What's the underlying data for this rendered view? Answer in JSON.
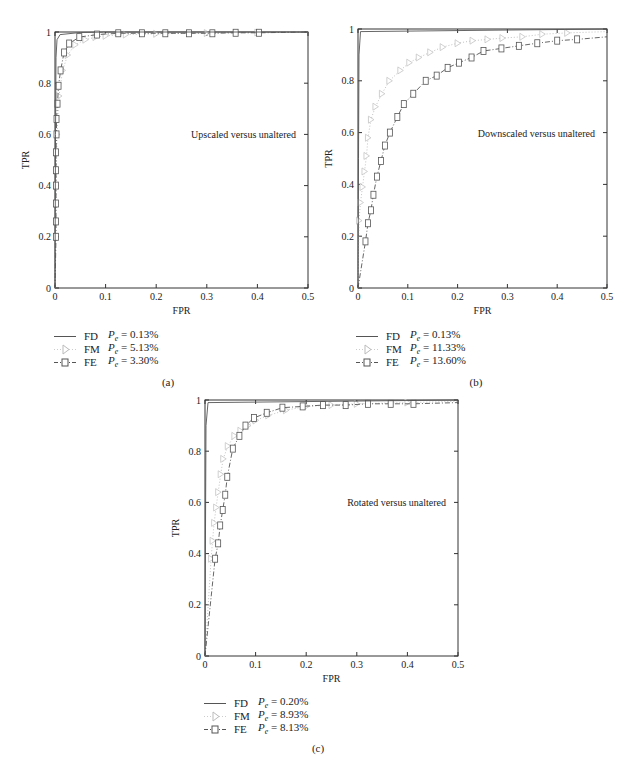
{
  "chart_data": [
    {
      "id": "a",
      "type": "line",
      "caption": "(a)",
      "annotation": "Upscaled versus unaltered",
      "xlabel": "FPR",
      "ylabel": "TPR",
      "xlim": [
        0,
        0.5
      ],
      "ylim": [
        0,
        1
      ],
      "xticks": [
        "0",
        "0.1",
        "0.2",
        "0.3",
        "0.4",
        "0.5"
      ],
      "yticks": [
        "0",
        "0.2",
        "0.4",
        "0.6",
        "0.8",
        "1"
      ],
      "grid": false,
      "legend_position": "below",
      "series": [
        {
          "name": "FD",
          "pe": "0.13%",
          "style": "solid",
          "color": "#555555",
          "marker": "none",
          "x": [
            0,
            0.001,
            0.002,
            0.004,
            0.01,
            0.05,
            0.1,
            0.5
          ],
          "y": [
            0,
            0.6,
            0.9,
            0.97,
            0.99,
            0.998,
            1.0,
            1.0
          ]
        },
        {
          "name": "FM",
          "pe": "5.13%",
          "style": "dotted",
          "color": "#bbbbbb",
          "marker": "triangle",
          "x": [
            0,
            0.002,
            0.004,
            0.008,
            0.015,
            0.025,
            0.04,
            0.06,
            0.08,
            0.1,
            0.14,
            0.2,
            0.3,
            0.4,
            0.5
          ],
          "y": [
            0,
            0.4,
            0.6,
            0.75,
            0.85,
            0.91,
            0.95,
            0.97,
            0.98,
            0.985,
            0.99,
            0.993,
            0.996,
            0.998,
            1.0
          ]
        },
        {
          "name": "FE",
          "pe": "3.30%",
          "style": "dashdot",
          "color": "#555555",
          "marker": "square",
          "x": [
            0,
            0.002,
            0.002,
            0.002,
            0.002,
            0.002,
            0.002,
            0.003,
            0.003,
            0.005,
            0.007,
            0.011,
            0.018,
            0.028,
            0.048,
            0.083,
            0.125,
            0.172,
            0.218,
            0.265,
            0.311,
            0.357,
            0.403,
            0.5
          ],
          "y": [
            0,
            0.2,
            0.26,
            0.33,
            0.4,
            0.46,
            0.53,
            0.6,
            0.66,
            0.72,
            0.79,
            0.85,
            0.92,
            0.955,
            0.98,
            0.99,
            0.995,
            0.995,
            0.995,
            0.995,
            0.995,
            0.997,
            0.997,
            1.0
          ]
        }
      ]
    },
    {
      "id": "b",
      "type": "line",
      "caption": "(b)",
      "annotation": "Downscaled versus unaltered",
      "xlabel": "FPR",
      "ylabel": "TPR",
      "xlim": [
        0,
        0.5
      ],
      "ylim": [
        0,
        1
      ],
      "xticks": [
        "0",
        "0.1",
        "0.2",
        "0.3",
        "0.4",
        "0.5"
      ],
      "yticks": [
        "0",
        "0.2",
        "0.4",
        "0.6",
        "0.8",
        "1"
      ],
      "grid": false,
      "legend_position": "below",
      "series": [
        {
          "name": "FD",
          "pe": "0.13%",
          "style": "solid",
          "color": "#555555",
          "marker": "none",
          "x": [
            0,
            0.001,
            0.002,
            0.005,
            0.5
          ],
          "y": [
            0,
            0.5,
            0.9,
            0.99,
            1.0
          ]
        },
        {
          "name": "FM",
          "pe": "11.33%",
          "style": "dotted",
          "color": "#bbbbbb",
          "marker": "triangle",
          "x": [
            0,
            0.002,
            0.005,
            0.009,
            0.013,
            0.017,
            0.02,
            0.026,
            0.035,
            0.048,
            0.063,
            0.085,
            0.103,
            0.122,
            0.145,
            0.17,
            0.2,
            0.23,
            0.26,
            0.29,
            0.33,
            0.37,
            0.42,
            0.5
          ],
          "y": [
            0,
            0.26,
            0.33,
            0.39,
            0.45,
            0.51,
            0.58,
            0.65,
            0.7,
            0.75,
            0.8,
            0.84,
            0.87,
            0.89,
            0.91,
            0.93,
            0.945,
            0.955,
            0.96,
            0.965,
            0.97,
            0.98,
            0.985,
            0.99
          ]
        },
        {
          "name": "FE",
          "pe": "13.60%",
          "style": "dashdot",
          "color": "#555555",
          "marker": "square",
          "x": [
            0,
            0.015,
            0.02,
            0.026,
            0.031,
            0.038,
            0.046,
            0.054,
            0.064,
            0.079,
            0.092,
            0.111,
            0.136,
            0.158,
            0.18,
            0.203,
            0.228,
            0.252,
            0.288,
            0.323,
            0.36,
            0.4,
            0.44,
            0.5
          ],
          "y": [
            0,
            0.18,
            0.25,
            0.3,
            0.36,
            0.43,
            0.49,
            0.55,
            0.6,
            0.66,
            0.71,
            0.75,
            0.8,
            0.82,
            0.85,
            0.87,
            0.89,
            0.915,
            0.925,
            0.935,
            0.945,
            0.955,
            0.96,
            0.97
          ]
        }
      ]
    },
    {
      "id": "c",
      "type": "line",
      "caption": "(c)",
      "annotation": "Rotated versus unaltered",
      "xlabel": "FPR",
      "ylabel": "TPR",
      "xlim": [
        0,
        0.5
      ],
      "ylim": [
        0,
        1
      ],
      "xticks": [
        "0",
        "0.1",
        "0.2",
        "0.3",
        "0.4",
        "0.5"
      ],
      "yticks": [
        "0",
        "0.2",
        "0.4",
        "0.6",
        "0.8",
        "1"
      ],
      "grid": false,
      "legend_position": "below",
      "series": [
        {
          "name": "FD",
          "pe": "0.20%",
          "style": "solid",
          "color": "#555555",
          "marker": "none",
          "x": [
            0,
            0.001,
            0.002,
            0.006,
            0.5
          ],
          "y": [
            0,
            0.5,
            0.9,
            0.99,
            1.0
          ]
        },
        {
          "name": "FM",
          "pe": "8.93%",
          "style": "dotted",
          "color": "#bbbbbb",
          "marker": "triangle",
          "x": [
            0,
            0.012,
            0.015,
            0.018,
            0.022,
            0.026,
            0.031,
            0.036,
            0.045,
            0.058,
            0.07,
            0.085,
            0.1,
            0.125,
            0.16,
            0.2,
            0.25,
            0.3,
            0.4,
            0.5
          ],
          "y": [
            0,
            0.38,
            0.45,
            0.52,
            0.58,
            0.64,
            0.71,
            0.77,
            0.82,
            0.86,
            0.88,
            0.9,
            0.92,
            0.94,
            0.96,
            0.975,
            0.98,
            0.985,
            0.99,
            0.995
          ]
        },
        {
          "name": "FE",
          "pe": "8.13%",
          "style": "dashdot",
          "color": "#555555",
          "marker": "square",
          "x": [
            0,
            0.02,
            0.026,
            0.03,
            0.035,
            0.04,
            0.044,
            0.055,
            0.068,
            0.08,
            0.097,
            0.122,
            0.153,
            0.193,
            0.233,
            0.278,
            0.322,
            0.367,
            0.412,
            0.5
          ],
          "y": [
            0,
            0.38,
            0.44,
            0.51,
            0.57,
            0.63,
            0.7,
            0.81,
            0.86,
            0.9,
            0.93,
            0.95,
            0.97,
            0.975,
            0.98,
            0.98,
            0.985,
            0.985,
            0.985,
            0.99
          ]
        }
      ]
    }
  ],
  "panels": [
    {
      "caption": "(a)",
      "legend": [
        {
          "name": "FD",
          "pe_label": "P",
          "pe_sub": "e",
          "pe_value": "= 0.13%"
        },
        {
          "name": "FM",
          "pe_label": "P",
          "pe_sub": "e",
          "pe_value": "= 5.13%"
        },
        {
          "name": "FE",
          "pe_label": "P",
          "pe_sub": "e",
          "pe_value": "= 3.30%"
        }
      ]
    },
    {
      "caption": "(b)",
      "legend": [
        {
          "name": "FD",
          "pe_label": "P",
          "pe_sub": "e",
          "pe_value": "= 0.13%"
        },
        {
          "name": "FM",
          "pe_label": "P",
          "pe_sub": "e",
          "pe_value": "= 11.33%"
        },
        {
          "name": "FE",
          "pe_label": "P",
          "pe_sub": "e",
          "pe_value": "= 13.60%"
        }
      ]
    },
    {
      "caption": "(c)",
      "legend": [
        {
          "name": "FD",
          "pe_label": "P",
          "pe_sub": "e",
          "pe_value": "= 0.20%"
        },
        {
          "name": "FM",
          "pe_label": "P",
          "pe_sub": "e",
          "pe_value": "= 8.93%"
        },
        {
          "name": "FE",
          "pe_label": "P",
          "pe_sub": "e",
          "pe_value": "= 8.13%"
        }
      ]
    }
  ]
}
